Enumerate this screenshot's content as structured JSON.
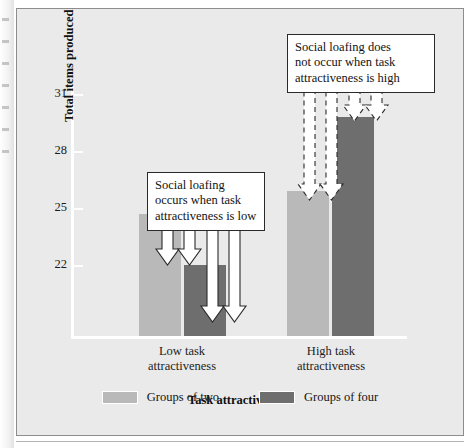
{
  "chart_data": {
    "type": "bar",
    "title": "",
    "xlabel": "Task attractiveness",
    "ylabel": "Total items produced",
    "categories": [
      "Low task attractiveness",
      "High task attractiveness"
    ],
    "series": [
      {
        "name": "Groups of two",
        "color": "#b9b9b9",
        "values": [
          24.7,
          25.9
        ]
      },
      {
        "name": "Groups of four",
        "color": "#6e6e6e",
        "values": [
          22.0,
          29.8
        ]
      }
    ],
    "ylim": [
      21.0,
      31.6
    ],
    "yticks": [
      31,
      28,
      25,
      22
    ],
    "ytick_labels": [
      "31",
      "28",
      "25",
      "22"
    ],
    "grid": false,
    "legend_position": "bottom",
    "annotations": [
      {
        "id": "low",
        "text": "Social loafing occurs when task attractiveness is low",
        "lines": [
          "Social loafing",
          "occurs when task",
          "attractiveness is low"
        ],
        "arrow_style": "solid",
        "points_to": [
          "Low task attractiveness / Groups of two",
          "Low task attractiveness / Groups of four"
        ]
      },
      {
        "id": "high",
        "text": "Social loafing does not occur when task attractiveness is high",
        "lines": [
          "Social loafing does",
          "not occur when task",
          "attractiveness is high"
        ],
        "arrow_style": "dashed",
        "points_to": [
          "High task attractiveness / Groups of two",
          "High task attractiveness / Groups of four"
        ]
      }
    ]
  },
  "axis": {
    "y_title": "Total items produced",
    "x_title": "Task attractiveness",
    "y_tick_0": "31",
    "y_tick_1": "28",
    "y_tick_2": "25",
    "y_tick_3": "22"
  },
  "categories": {
    "cat_0_line_0": "Low task",
    "cat_0_line_1": "attractiveness",
    "cat_1_line_0": "High task",
    "cat_1_line_1": "attractiveness"
  },
  "callouts": {
    "low": {
      "line_0": "Social loafing",
      "line_1": "occurs when task",
      "line_2": "attractiveness is low"
    },
    "high": {
      "line_0": "Social loafing does",
      "line_1": "not occur when task",
      "line_2": "attractiveness is high"
    }
  },
  "legend": {
    "item_0_label": "Groups of two",
    "item_1_label": "Groups of four"
  },
  "colors": {
    "light_bar": "#b9b9b9",
    "dark_bar": "#6e6e6e",
    "panel": "#eaeaea",
    "axis": "#ffffff"
  }
}
